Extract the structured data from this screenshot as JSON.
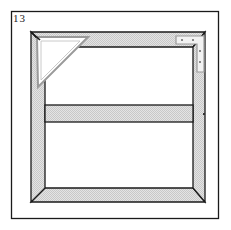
{
  "figure": {
    "label": "13"
  },
  "colors": {
    "line": "#1a1a1a",
    "frame_fill": "#dcdcdc",
    "brace_stroke": "#9a9a9a",
    "background": "#ffffff"
  },
  "parts": [
    {
      "name": "outer-border"
    },
    {
      "name": "frame"
    },
    {
      "name": "triangular-corner-brace"
    },
    {
      "name": "l-corner-plate"
    },
    {
      "name": "crossbar"
    }
  ]
}
